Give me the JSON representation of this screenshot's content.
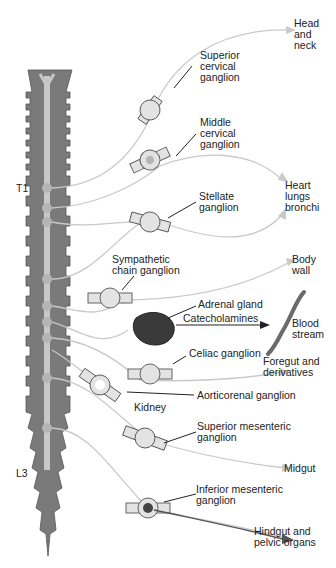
{
  "diagram": {
    "type": "sympathetic nervous system anatomy",
    "spinal_levels": {
      "upper": "T1",
      "lower": "L3"
    },
    "ganglia": [
      {
        "name": "Superior cervical ganglion",
        "target": "Head and neck"
      },
      {
        "name": "Middle cervical ganglion",
        "target": "Heart lungs bronchi"
      },
      {
        "name": "Stellate ganglion",
        "target": "Heart lungs bronchi"
      },
      {
        "name": "Sympathetic chain ganglion",
        "target": "Body wall"
      },
      {
        "name": "Adrenal gland",
        "target": "Blood stream",
        "via": "Catecholamines"
      },
      {
        "name": "Celiac ganglion",
        "target": "Foregut and derivatives"
      },
      {
        "name": "Aorticorenal ganglion",
        "target": "Kidney"
      },
      {
        "name": "Superior mesenteric ganglion",
        "target": "Midgut"
      },
      {
        "name": "Inferior mesenteric ganglion",
        "target": "Hindgut and pelvic organs"
      }
    ]
  },
  "labels": {
    "head_neck": "Head\nand\nneck",
    "superior_cervical": "Superior\ncervical\nganglion",
    "middle_cervical": "Middle\ncervical\nganglion",
    "t1": "T1",
    "heart": "Heart\nlungs\nbronchi",
    "stellate": "Stellate\nganglion",
    "sympathetic_chain": "Sympathetic\nchain ganglion",
    "body_wall": "Body\nwall",
    "adrenal": "Adrenal gland",
    "catecholamines": "Catecholamines",
    "blood_stream": "Blood\nstream",
    "celiac": "Celiac ganglion",
    "foregut": "Foregut and\nderivatives",
    "aorticorenal": "Aorticorenal ganglion",
    "kidney": "Kidney",
    "superior_mesenteric": "Superior mesenteric\nganglion",
    "midgut": "Midgut",
    "l3": "L3",
    "inferior_mesenteric": "Inferior mesenteric\nganglion",
    "hindgut": "Hindgut and\npelvic organs"
  },
  "colors": {
    "cord": "#7a7a7a",
    "cord_center": "#c8c8c8",
    "nerve": "#c9c9c9",
    "ganglion": "#e3e3e3",
    "outline": "#555555",
    "text": "#222222",
    "vessel": "#6b6b6b"
  }
}
